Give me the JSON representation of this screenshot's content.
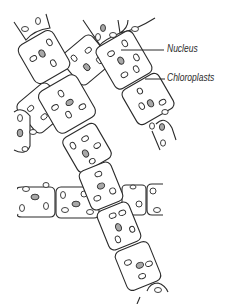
{
  "diagram": {
    "labels": [
      {
        "id": "nucleus",
        "text": "Nucleus"
      },
      {
        "id": "chloroplasts",
        "text": "Chloroplasts"
      }
    ],
    "colors": {
      "outline": "#2b2b2b",
      "nucleus_fill": "#a8a8a8",
      "chloroplast_fill": "#ffffff",
      "background": "#ffffff"
    },
    "filaments": [
      {
        "id": "A",
        "description": "long diagonal filament from upper-left to bottom-center"
      },
      {
        "id": "B",
        "description": "filament crossing from upper-center to left"
      },
      {
        "id": "C",
        "description": "filament from upper-center to right"
      },
      {
        "id": "D",
        "description": "horizontal filament in lower half"
      }
    ]
  }
}
